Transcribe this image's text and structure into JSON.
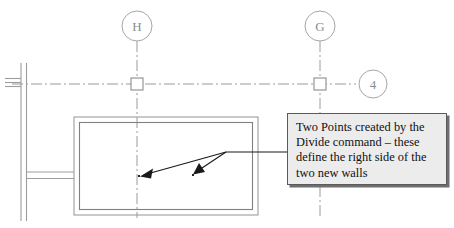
{
  "drawing": {
    "title": "architectural-plan-divide-points",
    "colors": {
      "grid_line": "#9a9a9a",
      "bubble_stroke": "#a6a6a6",
      "bubble_text": "#8c8c8c",
      "wall_line": "#9d9d9d",
      "wall_line_dark": "#808080",
      "leader_line": "#1a1a1a",
      "point_marker": "#222222",
      "callout_fill": "#ececed",
      "callout_border": "#5a5a5a",
      "callout_shadow": "#6e6e70",
      "callout_text": "#101010"
    },
    "grid_bubbles": [
      {
        "label": "H",
        "cx": 137,
        "cy": 26,
        "r": 15
      },
      {
        "label": "G",
        "cx": 320,
        "cy": 26,
        "r": 15
      },
      {
        "label": "4",
        "cx": 373,
        "cy": 84,
        "r": 14
      }
    ],
    "grid_nodes": [
      {
        "name": "node-h4",
        "x": 137,
        "y": 84
      },
      {
        "name": "node-g4",
        "x": 320,
        "y": 84
      }
    ],
    "point_markers": [
      {
        "name": "divide-point-left",
        "x": 139,
        "y": 176
      },
      {
        "name": "divide-point-right",
        "x": 193,
        "y": 175
      }
    ],
    "leader_origin": {
      "x": 226,
      "y": 152
    }
  },
  "callout": {
    "text": "Two Points created by the\nDivide command – these\ndefine the right side of the\ntwo new walls",
    "x": 287,
    "y": 113,
    "width": 160,
    "height": 72
  }
}
